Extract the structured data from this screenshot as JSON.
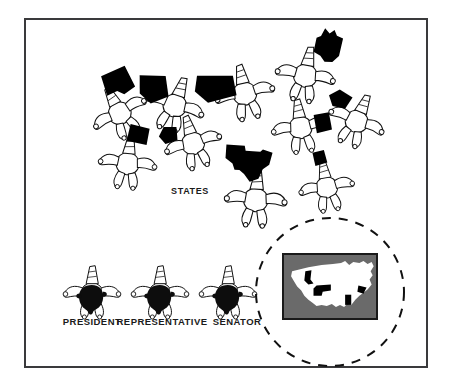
{
  "figure": {
    "background_color": "#ffffff",
    "frame_color": "#3a3a3c"
  },
  "labels": {
    "states": "STATES",
    "president": "PRESIDENT",
    "representative": "REPRESENTATIVE",
    "senator": "SENATOR"
  },
  "groups": {
    "states_group": {
      "label": "STATES",
      "label_x": 190,
      "label_y": 192,
      "count": 11,
      "skydivers": [
        {
          "name": "skydiver-state-1",
          "x": 118,
          "y": 110,
          "rot": -28,
          "scale": 0.92,
          "shape": "state-blob-a",
          "shape_dx": 14,
          "shape_dy": -26,
          "shape_rot": 8,
          "shape_scale": 1.0
        },
        {
          "name": "skydiver-state-2",
          "x": 176,
          "y": 102,
          "rot": 18,
          "scale": 0.95,
          "shape": "state-blob-b",
          "shape_dx": -26,
          "shape_dy": -6,
          "shape_rot": -12,
          "shape_scale": 1.05
        },
        {
          "name": "skydiver-state-3",
          "x": 244,
          "y": 90,
          "rot": -12,
          "scale": 0.95,
          "shape": "state-blob-c",
          "shape_dx": -28,
          "shape_dy": -8,
          "shape_rot": 20,
          "shape_scale": 1.1
        },
        {
          "name": "skydiver-state-4",
          "x": 306,
          "y": 72,
          "rot": 10,
          "scale": 0.95,
          "shape": "state-minnesota",
          "shape_dx": 18,
          "shape_dy": -30,
          "shape_rot": 6,
          "shape_scale": 1.0
        },
        {
          "name": "skydiver-state-5",
          "x": 300,
          "y": 124,
          "rot": -8,
          "scale": 0.92,
          "shape": "state-blob-d",
          "shape_dx": 24,
          "shape_dy": 2,
          "shape_rot": 0,
          "shape_scale": 0.8
        },
        {
          "name": "skydiver-state-6",
          "x": 358,
          "y": 118,
          "rot": 22,
          "scale": 0.92,
          "shape": "state-blob-e",
          "shape_dx": -24,
          "shape_dy": -12,
          "shape_rot": -24,
          "shape_scale": 0.85
        },
        {
          "name": "skydiver-state-7",
          "x": 128,
          "y": 160,
          "rot": 6,
          "scale": 0.92,
          "shape": "state-blob-f",
          "shape_dx": 8,
          "shape_dy": -28,
          "shape_rot": 10,
          "shape_scale": 0.85
        },
        {
          "name": "skydiver-state-8",
          "x": 192,
          "y": 140,
          "rot": -16,
          "scale": 0.92,
          "shape": "state-blob-g",
          "shape_dx": -22,
          "shape_dy": -12,
          "shape_rot": -8,
          "shape_scale": 0.8
        },
        {
          "name": "skydiver-state-9",
          "x": 256,
          "y": 196,
          "rot": 4,
          "scale": 0.98,
          "shape": "state-texas",
          "shape_dx": -10,
          "shape_dy": -34,
          "shape_rot": 0,
          "shape_scale": 1.25
        },
        {
          "name": "skydiver-state-10",
          "x": 326,
          "y": 184,
          "rot": -10,
          "scale": 0.88,
          "shape": "state-blob-h",
          "shape_dx": -2,
          "shape_dy": -30,
          "shape_rot": 0,
          "shape_scale": 0.7
        }
      ]
    },
    "officials": {
      "items": [
        {
          "name": "skydiver-president",
          "label": "PRESIDENT",
          "x": 92,
          "y": 290,
          "label_x": 92,
          "label_y": 322
        },
        {
          "name": "skydiver-representative",
          "label": "REPRESENTATIVE",
          "x": 160,
          "y": 290,
          "label_x": 160,
          "label_y": 322
        },
        {
          "name": "skydiver-senator",
          "label": "SENATOR",
          "x": 228,
          "y": 290,
          "label_x": 228,
          "label_y": 322
        }
      ]
    }
  },
  "inset": {
    "name": "usa-map-inset",
    "circle": {
      "cx": 330,
      "cy": 292,
      "r": 74,
      "dashed": true,
      "stroke": "#111111"
    },
    "map": {
      "x": 283,
      "y": 254,
      "width": 94,
      "height": 65,
      "background_color": "#6a6a6a",
      "border_color": "#1a1a1a",
      "land_color": "#ffffff",
      "highlight_color": "#000000",
      "highlighted_states": [
        "Idaho",
        "Nebraska",
        "Alabama",
        "Virginia"
      ]
    }
  }
}
